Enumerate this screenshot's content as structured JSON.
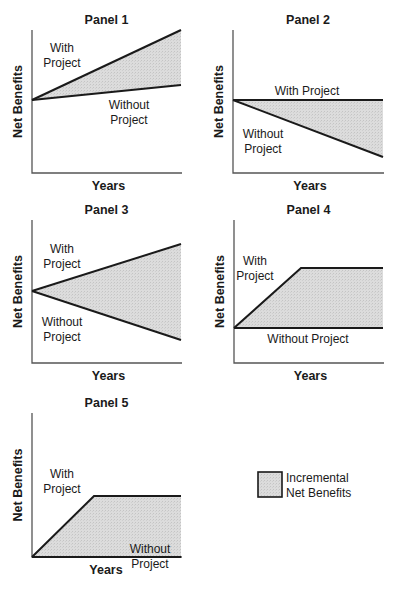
{
  "figure": {
    "legend": {
      "label_line1": "Incremental",
      "label_line2": "Net Benefits",
      "fill_color": "#d9d9d9"
    },
    "colors": {
      "line": "#1a1a1a",
      "axis": "#555555",
      "fill": "#d9d9d9"
    }
  },
  "chart_data": [
    {
      "type": "area",
      "title": "Panel 1",
      "xlabel": "Years",
      "ylabel": "Net Benefits",
      "box": {
        "x0": 32,
        "y0": 30,
        "x1": 181,
        "y1": 173
      },
      "with_project": [
        [
          32,
          100
        ],
        [
          181,
          30
        ]
      ],
      "without_project": [
        [
          32,
          100
        ],
        [
          181,
          85
        ]
      ],
      "labels": [
        {
          "text": "With",
          "x": 62,
          "y": 52
        },
        {
          "text": "Project",
          "x": 62,
          "y": 67
        },
        {
          "text": "Without",
          "x": 129,
          "y": 109
        },
        {
          "text": "Project",
          "x": 129,
          "y": 124
        }
      ],
      "description": "With-project net benefits rise faster than without-project; both start at the same level and increase."
    },
    {
      "type": "area",
      "title": "Panel 2",
      "xlabel": "Years",
      "ylabel": "Net Benefits",
      "box": {
        "x0": 233,
        "y0": 30,
        "x1": 383,
        "y1": 173
      },
      "with_project": [
        [
          233,
          100
        ],
        [
          383,
          100
        ]
      ],
      "without_project": [
        [
          233,
          100
        ],
        [
          383,
          157
        ]
      ],
      "labels": [
        {
          "text": "With Project",
          "x": 307,
          "y": 95
        },
        {
          "text": "Without",
          "x": 263,
          "y": 138
        },
        {
          "text": "Project",
          "x": 263,
          "y": 153
        }
      ],
      "description": "With-project net benefits are constant; without-project net benefits decline."
    },
    {
      "type": "area",
      "title": "Panel 3",
      "xlabel": "Years",
      "ylabel": "Net Benefits",
      "box": {
        "x0": 32,
        "y0": 220,
        "x1": 181,
        "y1": 363
      },
      "with_project": [
        [
          32,
          291
        ],
        [
          181,
          244
        ]
      ],
      "without_project": [
        [
          32,
          291
        ],
        [
          181,
          340
        ]
      ],
      "labels": [
        {
          "text": "With",
          "x": 62,
          "y": 253
        },
        {
          "text": "Project",
          "x": 62,
          "y": 268
        },
        {
          "text": "Without",
          "x": 62,
          "y": 326
        },
        {
          "text": "Project",
          "x": 62,
          "y": 341
        }
      ],
      "description": "With-project net benefits rise while without-project net benefits decline."
    },
    {
      "type": "area",
      "title": "Panel 4",
      "xlabel": "Years",
      "ylabel": "Net Benefits",
      "box": {
        "x0": 234,
        "y0": 220,
        "x1": 383,
        "y1": 363
      },
      "with_project": [
        [
          234,
          328
        ],
        [
          301,
          268
        ],
        [
          383,
          268
        ]
      ],
      "without_project": [
        [
          234,
          328
        ],
        [
          383,
          328
        ]
      ],
      "labels": [
        {
          "text": "With",
          "x": 255,
          "y": 265
        },
        {
          "text": "Project",
          "x": 255,
          "y": 280
        },
        {
          "text": "Without Project",
          "x": 308,
          "y": 343
        }
      ],
      "description": "With-project net benefits ramp up then level off; without-project net benefits are constant at a positive level."
    },
    {
      "type": "area",
      "title": "Panel 5",
      "xlabel": "Years",
      "ylabel": "Net Benefits",
      "box": {
        "x0": 32,
        "y0": 413,
        "x1": 181,
        "y1": 557
      },
      "with_project": [
        [
          32,
          557
        ],
        [
          94,
          496
        ],
        [
          181,
          496
        ]
      ],
      "without_project": [
        [
          32,
          557
        ],
        [
          181,
          557
        ]
      ],
      "labels": [
        {
          "text": "With",
          "x": 62,
          "y": 478
        },
        {
          "text": "Project",
          "x": 62,
          "y": 493
        },
        {
          "text": "Without",
          "x": 150,
          "y": 553
        },
        {
          "text": "Project",
          "x": 150,
          "y": 568
        }
      ],
      "description": "With-project net benefits ramp up from zero then level off; without-project net benefits are zero."
    }
  ]
}
